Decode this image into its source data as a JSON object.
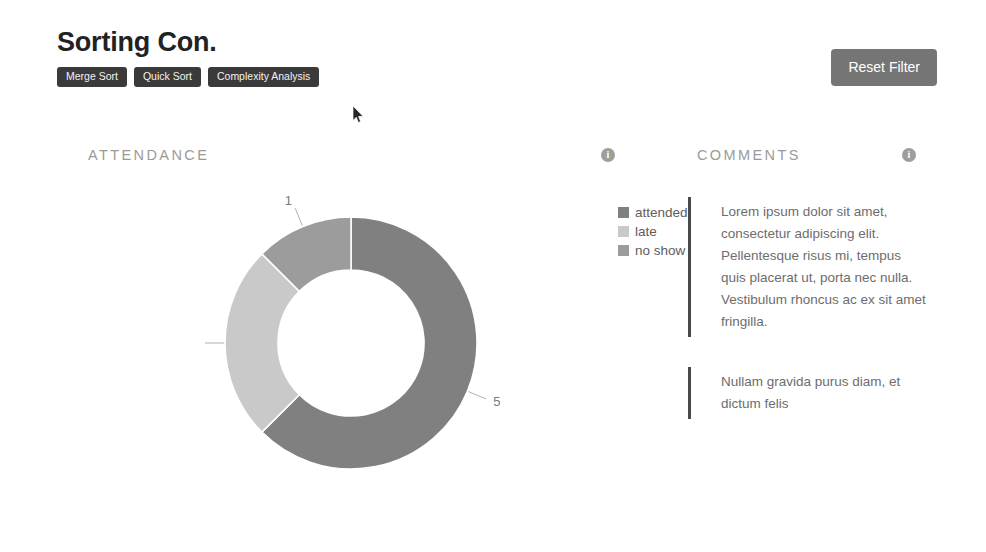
{
  "header": {
    "title": "Sorting Con.",
    "tags": [
      {
        "label": "Merge Sort"
      },
      {
        "label": "Quick Sort"
      },
      {
        "label": "Complexity Analysis"
      }
    ],
    "reset_label": "Reset Filter"
  },
  "panels": {
    "attendance": {
      "title": "ATTENDANCE",
      "info": "i"
    },
    "comments": {
      "title": "COMMENTS",
      "info": "i"
    }
  },
  "chart_data": {
    "type": "pie",
    "title": "ATTENDANCE",
    "variant": "donut",
    "categories": [
      "attended",
      "late",
      "no show"
    ],
    "values": [
      5,
      2,
      1
    ],
    "total": 8,
    "colors": [
      "#808080",
      "#c9c9c9",
      "#9c9c9c"
    ],
    "labels": [
      "5",
      "2",
      "1"
    ],
    "legend_position": "right",
    "start_angle_deg": 90,
    "direction": "clockwise",
    "inner_radius_ratio": 0.58
  },
  "legend": [
    {
      "label": "attended",
      "color": "#808080"
    },
    {
      "label": "late",
      "color": "#c9c9c9"
    },
    {
      "label": "no show",
      "color": "#9c9c9c"
    }
  ],
  "comments": [
    {
      "text": "Lorem ipsum dolor sit amet, consectetur adipiscing elit. Pellentesque risus mi, tempus quis placerat ut, porta nec nulla. Vestibulum rhoncus ac ex sit amet fringilla."
    },
    {
      "text": "Nullam gravida purus diam, et dictum felis"
    }
  ]
}
